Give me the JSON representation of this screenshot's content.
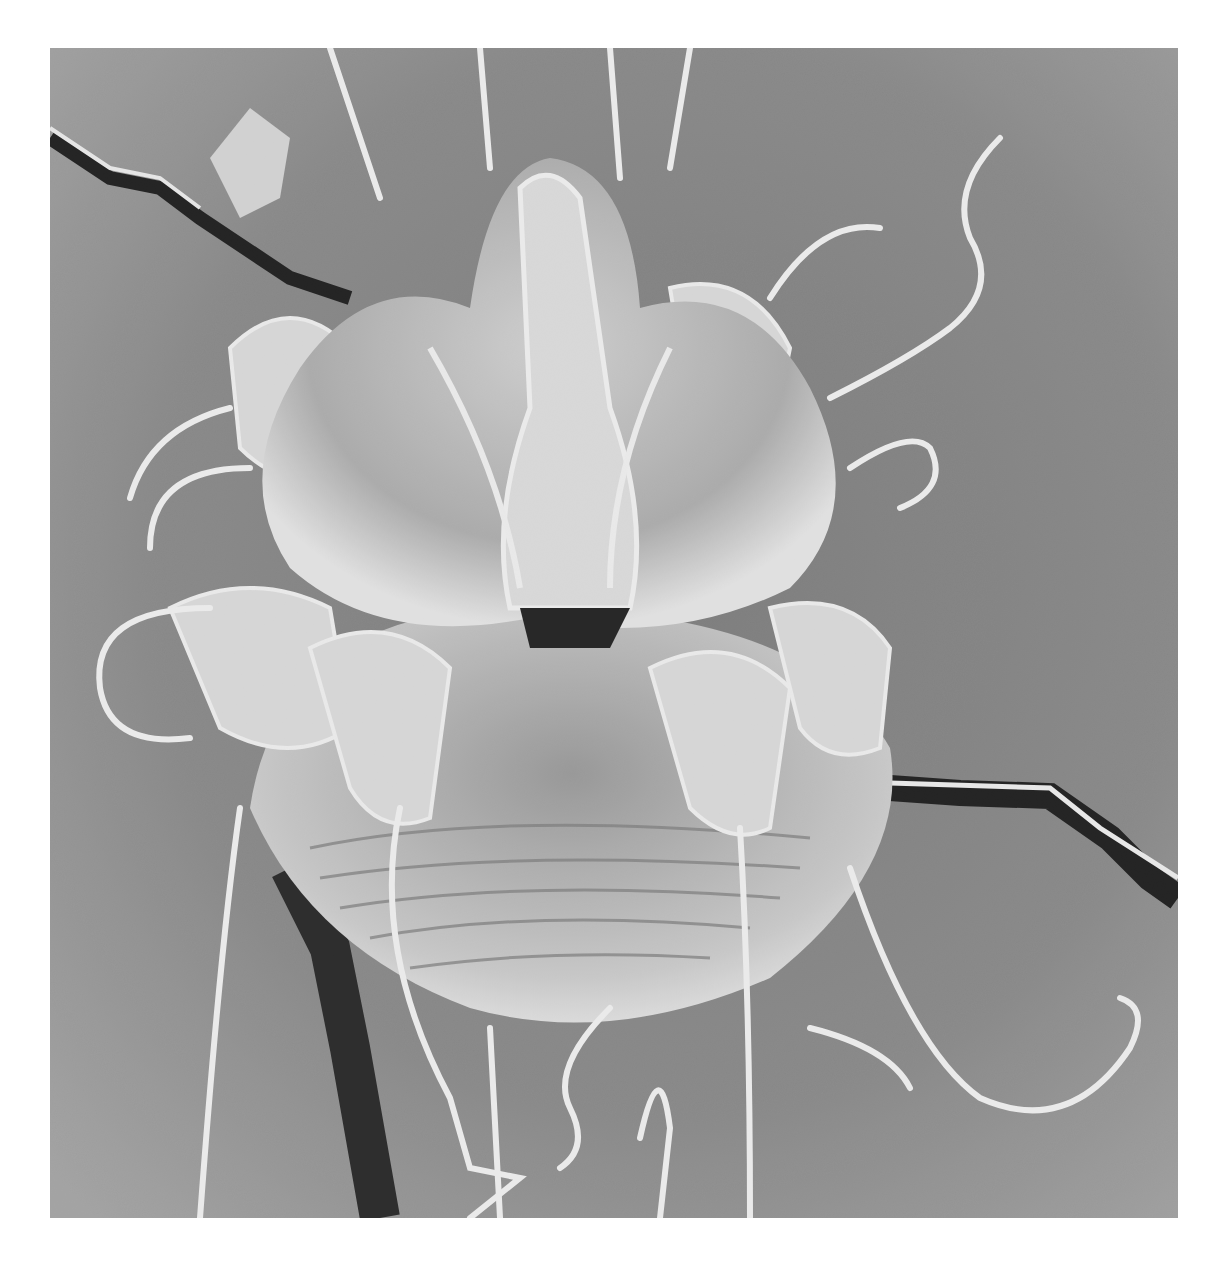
{
  "image": {
    "subject": "scanning electron micrograph of a mite",
    "description": "Grayscale SEM image of a mite (ventral view) with long bristle-like setae on a grey substrate with cracks",
    "colors": {
      "background_page": "#ffffff",
      "substrate": "#8c8c8c",
      "substrate_light": "#b4b4b4",
      "body_light": "#e6e6e6",
      "body_mid": "#a8a8a8",
      "shadow": "#1a1a1a",
      "setae": "#fafafa"
    }
  }
}
